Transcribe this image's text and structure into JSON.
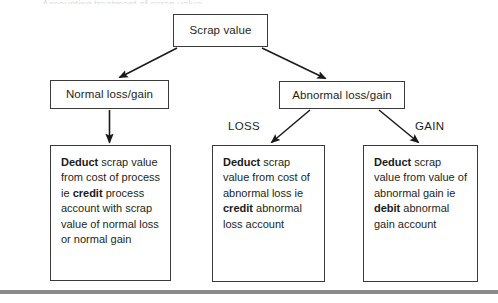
{
  "diagram": {
    "title": "Accounting treatment of scrap value",
    "nodes": {
      "scrap_value": {
        "label": "Scrap value"
      },
      "normal": {
        "label": "Normal loss/gain"
      },
      "abnormal": {
        "label": "Abnormal loss/gain"
      },
      "normal_action": {
        "segments": [
          {
            "text": "Deduct",
            "bold": true
          },
          {
            "text": " scrap value from cost of process ie ",
            "bold": false
          },
          {
            "text": "credit",
            "bold": true
          },
          {
            "text": " process account with scrap value of normal loss or normal gain",
            "bold": false
          }
        ],
        "plain": "Deduct scrap value from cost of process ie credit process account with scrap value of normal loss or normal gain"
      },
      "loss_action": {
        "segments": [
          {
            "text": "Deduct",
            "bold": true
          },
          {
            "text": " scrap value from cost of abnormal loss ie ",
            "bold": false
          },
          {
            "text": "credit",
            "bold": true
          },
          {
            "text": " abnormal loss account",
            "bold": false
          }
        ],
        "plain": "Deduct scrap value from cost of abnormal loss ie credit abnormal loss account"
      },
      "gain_action": {
        "segments": [
          {
            "text": "Deduct",
            "bold": true
          },
          {
            "text": " scrap value from value of abnormal gain ie ",
            "bold": false
          },
          {
            "text": "debit",
            "bold": true
          },
          {
            "text": " abnormal gain account",
            "bold": false
          }
        ],
        "plain": "Deduct scrap value from value of abnormal gain ie debit abnormal gain account"
      }
    },
    "branch_labels": {
      "loss": "LOSS",
      "gain": "GAIN"
    },
    "edges": [
      {
        "name": "scrap-to-normal",
        "from": "scrap_value",
        "to": "normal",
        "label": ""
      },
      {
        "name": "scrap-to-abnormal",
        "from": "scrap_value",
        "to": "abnormal",
        "label": ""
      },
      {
        "name": "normal-to-action",
        "from": "normal",
        "to": "normal_action",
        "label": ""
      },
      {
        "name": "abnormal-to-loss",
        "from": "abnormal",
        "to": "loss_action",
        "label": "LOSS"
      },
      {
        "name": "abnormal-to-gain",
        "from": "abnormal",
        "to": "gain_action",
        "label": "GAIN"
      }
    ],
    "colors": {
      "box_border": "#3a3a3a",
      "text": "#231f20",
      "connector": "#1a1a1a",
      "rule": "#8b8b8b",
      "background": "#ffffff"
    }
  }
}
